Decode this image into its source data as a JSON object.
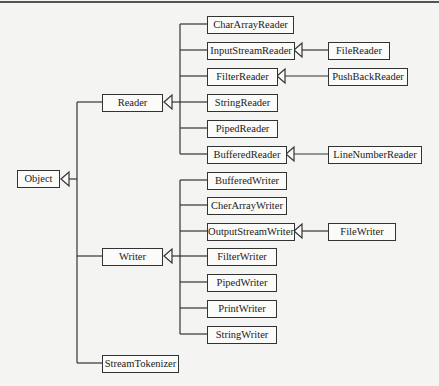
{
  "diagram": {
    "type": "class-hierarchy",
    "root": "Object",
    "level1": [
      "Reader",
      "Writer",
      "StreamTokenizer"
    ],
    "reader_subclasses": [
      "CharArrayReader",
      "InputStreamReader",
      "FilterReader",
      "StringReader",
      "PipedReader",
      "BufferedReader"
    ],
    "writer_subclasses": [
      "BufferedWriter",
      "CherArrayWriter",
      "OutputStreamWriter",
      "FilterWriter",
      "PipedWriter",
      "PrintWriter",
      "StringWriter"
    ],
    "level3": [
      {
        "label": "FileReader",
        "parent": "InputStreamReader"
      },
      {
        "label": "PushBackReader",
        "parent": "FilterReader"
      },
      {
        "label": "LineNumberReader",
        "parent": "BufferedReader"
      },
      {
        "label": "FileWriter",
        "parent": "OutputStreamWriter"
      }
    ]
  },
  "nodes": {
    "object": "Object",
    "reader": "Reader",
    "writer": "Writer",
    "stream_tokenizer": "StreamTokenizer",
    "char_array_reader": "CharArrayReader",
    "input_stream_reader": "InputStreamReader",
    "filter_reader": "FilterReader",
    "string_reader": "StringReader",
    "piped_reader": "PipedReader",
    "buffered_reader": "BufferedReader",
    "buffered_writer": "BufferedWriter",
    "char_array_writer": "CherArrayWriter",
    "output_stream_writer": "OutputStreamWriter",
    "filter_writer": "FilterWriter",
    "piped_writer": "PipedWriter",
    "print_writer": "PrintWriter",
    "string_writer": "StringWriter",
    "file_reader": "FileReader",
    "push_back_reader": "PushBackReader",
    "line_number_reader": "LineNumberReader",
    "file_writer": "FileWriter"
  }
}
